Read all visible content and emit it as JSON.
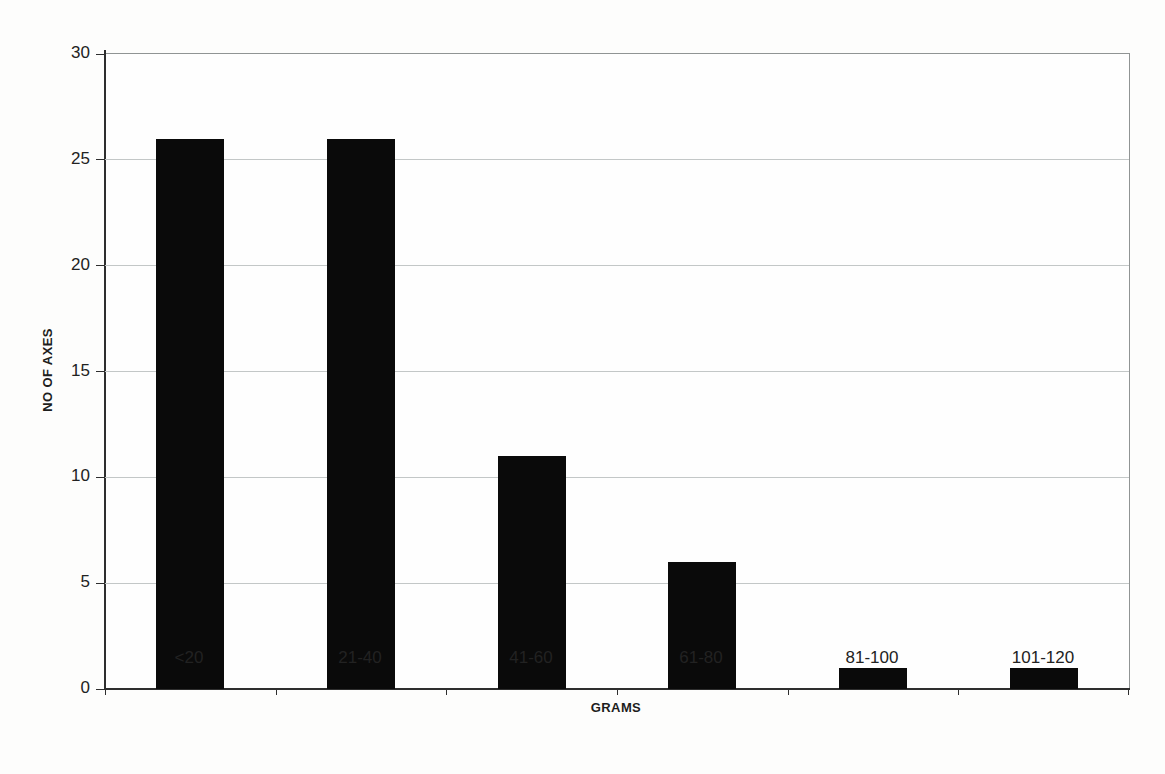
{
  "chart_data": {
    "type": "bar",
    "title": "",
    "categories": [
      "<20",
      "21-40",
      "41-60",
      "61-80",
      "81-100",
      "101-120"
    ],
    "values": [
      26,
      26,
      11,
      6,
      1,
      1
    ],
    "xlabel": "GRAMS",
    "ylabel": "NO OF AXES",
    "ylim": [
      0,
      30
    ],
    "yticks": [
      0,
      5,
      10,
      15,
      20,
      25,
      30
    ],
    "grid": "horizontal",
    "legend": "none",
    "bar_color": "#0a0a0a",
    "gridline_color": "#c3c7c7",
    "axis_color": "#2e2e2e",
    "border_color": "#909494",
    "text_color": "#222222",
    "background_color": "#fdfdfc"
  }
}
